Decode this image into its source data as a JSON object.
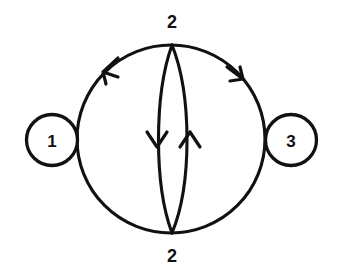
{
  "diagram": {
    "type": "directed-multigraph",
    "background_color": "#ffffff",
    "stroke_color": "#111111",
    "nodes": [
      {
        "id": "n1",
        "label": "1",
        "cx": 52,
        "cy": 140,
        "r": 25.5,
        "shape": "circle"
      },
      {
        "id": "n2_top",
        "label": "2",
        "cx": 172,
        "cy": 22,
        "r": 0,
        "shape": "label-only"
      },
      {
        "id": "n3",
        "label": "3",
        "cx": 291,
        "cy": 140,
        "r": 25.5,
        "shape": "circle"
      },
      {
        "id": "n2_bottom",
        "label": "2",
        "cx": 172,
        "cy": 256,
        "r": 0,
        "shape": "label-only"
      }
    ],
    "outer_circle": {
      "cx": 171,
      "cy": 139,
      "r": 94
    },
    "edges": [
      {
        "id": "e1",
        "from": "1",
        "to": "2",
        "shape": "outer-arc-upper-left",
        "direction": "counterclockwise",
        "arrow": "up-right"
      },
      {
        "id": "e2",
        "from": "2",
        "to": "3",
        "shape": "outer-arc-upper-right",
        "direction": "clockwise",
        "arrow": "down-right"
      },
      {
        "id": "e3",
        "from": "2",
        "to": "2",
        "shape": "lens-left-arc",
        "direction": "downward",
        "arrow": "down"
      },
      {
        "id": "e4",
        "from": "2",
        "to": "2",
        "shape": "lens-right-arc",
        "direction": "upward",
        "arrow": "up"
      },
      {
        "id": "e5",
        "from": "1",
        "to": "2",
        "shape": "outer-arc-lower-left",
        "direction": "none",
        "arrow": "none"
      },
      {
        "id": "e6",
        "from": "2",
        "to": "3",
        "shape": "outer-arc-lower-right",
        "direction": "none",
        "arrow": "none"
      }
    ]
  }
}
